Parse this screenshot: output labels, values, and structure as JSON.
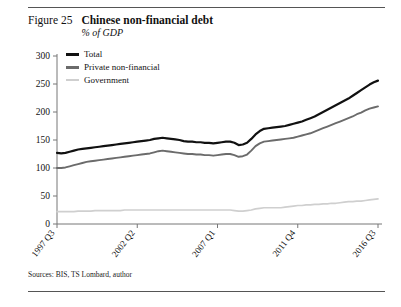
{
  "figure": {
    "number": "Figure 25",
    "title": "Chinese non-financial debt",
    "subtitle": "% of GDP",
    "source": "Sources: BIS, TS Lombard, author"
  },
  "colors": {
    "total": "#111111",
    "private": "#6b6b6b",
    "government": "#cfcfcf",
    "axis": "#777777",
    "rule": "#555555"
  },
  "legend": {
    "position": "top-left-inside",
    "items": [
      {
        "label": "Total",
        "color": "#111111"
      },
      {
        "label": "Private non-financial",
        "color": "#6b6b6b"
      },
      {
        "label": "Government",
        "color": "#cfcfcf"
      }
    ]
  },
  "chart_data": {
    "type": "line",
    "title": "Chinese non-financial debt",
    "subtitle": "% of GDP",
    "xlabel": "",
    "ylabel": "% of GDP",
    "ylim": [
      0,
      300
    ],
    "yticks": [
      0,
      50,
      100,
      150,
      200,
      250,
      300
    ],
    "grid": false,
    "xticks": [
      "1997 Q3",
      "2002 Q2",
      "2007 Q1",
      "2011 Q4",
      "2016 Q3"
    ],
    "xtick_index": [
      0,
      19,
      38,
      57,
      76
    ],
    "x": [
      "1997 Q3",
      "1997 Q4",
      "1998 Q1",
      "1998 Q2",
      "1998 Q3",
      "1998 Q4",
      "1999 Q1",
      "1999 Q2",
      "1999 Q3",
      "1999 Q4",
      "2000 Q1",
      "2000 Q2",
      "2000 Q3",
      "2000 Q4",
      "2001 Q1",
      "2001 Q2",
      "2001 Q3",
      "2001 Q4",
      "2002 Q1",
      "2002 Q2",
      "2002 Q3",
      "2002 Q4",
      "2003 Q1",
      "2003 Q2",
      "2003 Q3",
      "2003 Q4",
      "2004 Q1",
      "2004 Q2",
      "2004 Q3",
      "2004 Q4",
      "2005 Q1",
      "2005 Q2",
      "2005 Q3",
      "2005 Q4",
      "2006 Q1",
      "2006 Q2",
      "2006 Q3",
      "2006 Q4",
      "2007 Q1",
      "2007 Q2",
      "2007 Q3",
      "2007 Q4",
      "2008 Q1",
      "2008 Q2",
      "2008 Q3",
      "2008 Q4",
      "2009 Q1",
      "2009 Q2",
      "2009 Q3",
      "2009 Q4",
      "2010 Q1",
      "2010 Q2",
      "2010 Q3",
      "2010 Q4",
      "2011 Q1",
      "2011 Q2",
      "2011 Q3",
      "2011 Q4",
      "2012 Q1",
      "2012 Q2",
      "2012 Q3",
      "2012 Q4",
      "2013 Q1",
      "2013 Q2",
      "2013 Q3",
      "2013 Q4",
      "2014 Q1",
      "2014 Q2",
      "2014 Q3",
      "2014 Q4",
      "2015 Q1",
      "2015 Q2",
      "2015 Q3",
      "2015 Q4",
      "2016 Q1",
      "2016 Q2",
      "2016 Q3"
    ],
    "series": [
      {
        "name": "Total",
        "color": "#111111",
        "values": [
          127,
          126,
          127,
          129,
          131,
          133,
          134,
          135,
          136,
          137,
          138,
          139,
          140,
          141,
          142,
          143,
          144,
          145,
          146,
          147,
          148,
          149,
          150,
          152,
          153,
          154,
          153,
          152,
          151,
          150,
          148,
          147,
          147,
          146,
          146,
          145,
          145,
          144,
          145,
          146,
          147,
          147,
          145,
          141,
          142,
          145,
          152,
          160,
          166,
          170,
          171,
          172,
          173,
          174,
          175,
          177,
          179,
          181,
          183,
          186,
          189,
          192,
          196,
          200,
          204,
          208,
          212,
          216,
          220,
          224,
          229,
          234,
          239,
          244,
          249,
          253,
          256
        ]
      },
      {
        "name": "Private non-financial",
        "color": "#6b6b6b",
        "values": [
          100,
          100,
          101,
          103,
          105,
          107,
          109,
          111,
          112,
          113,
          114,
          115,
          116,
          117,
          118,
          119,
          120,
          121,
          122,
          123,
          124,
          125,
          126,
          128,
          130,
          131,
          130,
          129,
          128,
          127,
          126,
          125,
          125,
          124,
          124,
          123,
          123,
          122,
          123,
          124,
          125,
          125,
          123,
          120,
          121,
          124,
          131,
          139,
          144,
          147,
          148,
          149,
          150,
          151,
          152,
          153,
          154,
          156,
          158,
          160,
          162,
          165,
          168,
          171,
          174,
          177,
          180,
          183,
          186,
          189,
          192,
          196,
          199,
          203,
          206,
          208,
          210
        ]
      },
      {
        "name": "Government",
        "color": "#cfcfcf",
        "values": [
          22,
          22,
          22,
          22,
          22,
          23,
          23,
          23,
          23,
          24,
          24,
          24,
          24,
          24,
          24,
          24,
          25,
          25,
          25,
          25,
          25,
          25,
          25,
          25,
          25,
          25,
          25,
          25,
          25,
          25,
          25,
          25,
          25,
          25,
          25,
          25,
          25,
          25,
          25,
          25,
          25,
          25,
          24,
          23,
          23,
          24,
          25,
          27,
          28,
          29,
          29,
          29,
          29,
          29,
          30,
          31,
          32,
          33,
          33,
          34,
          34,
          35,
          35,
          36,
          36,
          37,
          37,
          38,
          39,
          40,
          40,
          41,
          41,
          42,
          43,
          44,
          45
        ]
      }
    ]
  }
}
